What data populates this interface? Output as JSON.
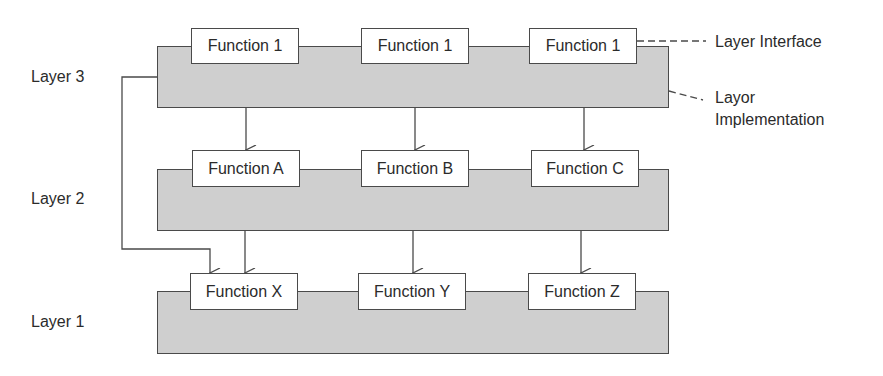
{
  "diagram": {
    "layers": [
      {
        "label": "Layer 3",
        "functions": [
          "Function 1",
          "Function 1",
          "Function 1"
        ]
      },
      {
        "label": "Layer 2",
        "functions": [
          "Function A",
          "Function B",
          "Function C"
        ]
      },
      {
        "label": "Layer 1",
        "functions": [
          "Function X",
          "Function Y",
          "Function Z"
        ]
      }
    ],
    "annotations": {
      "interface": "Layer Interface",
      "implementation_line1": "Layor",
      "implementation_line2": "Implementation"
    },
    "edges": [
      {
        "from": "Layer 3 / Function 1 (left)",
        "to": "Function A"
      },
      {
        "from": "Layer 3 / Function 1 (middle)",
        "to": "Function B"
      },
      {
        "from": "Layer 3 / Function 1 (right)",
        "to": "Function C"
      },
      {
        "from": "Layer 3 (bypass)",
        "to": "Function X"
      },
      {
        "from": "Function A",
        "to": "Function X"
      },
      {
        "from": "Function B",
        "to": "Function Y"
      },
      {
        "from": "Function C",
        "to": "Function Z"
      }
    ],
    "colors": {
      "layer_fill": "#cfcfcf",
      "box_fill": "#ffffff",
      "stroke": "#4a4a4a",
      "text": "#2b2b2b"
    }
  }
}
